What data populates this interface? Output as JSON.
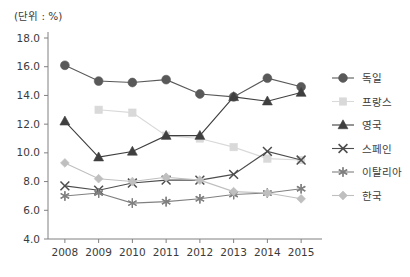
{
  "unit_label": "(단위 : %)",
  "chart_data": {
    "type": "line",
    "title": "",
    "subtitle": "",
    "xlabel": "",
    "ylabel": "",
    "unit_note": "(단위 : %)",
    "categories": [
      "2008",
      "2009",
      "2010",
      "2011",
      "2012",
      "2013",
      "2014",
      "2015"
    ],
    "ylim": [
      4.0,
      18.0
    ],
    "yticks": [
      "4.0",
      "6.0",
      "8.0",
      "10.0",
      "12.0",
      "14.0",
      "16.0",
      "18.0"
    ],
    "ytick_values": [
      4.0,
      6.0,
      8.0,
      10.0,
      12.0,
      14.0,
      16.0,
      18.0
    ],
    "grid": false,
    "legend_position": "right",
    "series": [
      {
        "name": "독일",
        "marker": "circle",
        "color": "#595959",
        "values": [
          16.1,
          15.0,
          14.9,
          15.1,
          14.1,
          13.9,
          15.2,
          14.6
        ]
      },
      {
        "name": "프랑스",
        "marker": "square",
        "color": "#d9d9d9",
        "values": [
          null,
          13.0,
          12.8,
          11.2,
          11.0,
          10.4,
          9.6,
          9.5
        ]
      },
      {
        "name": "영국",
        "marker": "triangle",
        "color": "#3f3f3f",
        "values": [
          12.2,
          9.7,
          10.1,
          11.2,
          11.2,
          13.9,
          13.6,
          14.2
        ]
      },
      {
        "name": "스페인",
        "marker": "x",
        "color": "#4d4d4d",
        "values": [
          7.7,
          7.4,
          7.9,
          8.1,
          8.1,
          8.5,
          10.1,
          9.5
        ]
      },
      {
        "name": "이탈리아",
        "marker": "asterisk",
        "color": "#808080",
        "values": [
          7.0,
          7.2,
          6.5,
          6.6,
          6.8,
          7.1,
          7.2,
          7.5
        ]
      },
      {
        "name": "한국",
        "marker": "diamond",
        "color": "#bfbfbf",
        "values": [
          9.3,
          8.2,
          8.0,
          8.3,
          8.1,
          7.3,
          7.2,
          6.8
        ]
      }
    ]
  }
}
